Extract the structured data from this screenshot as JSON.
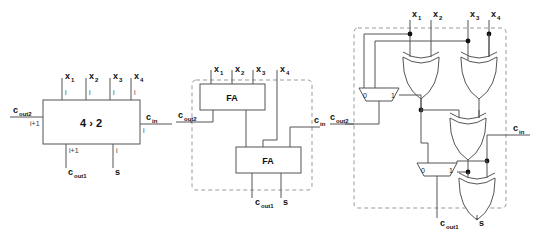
{
  "figure": {
    "background": "#ffffff",
    "line_color": "#555555",
    "dash_color": "#999999",
    "text_color": "#111111"
  },
  "panel_block": {
    "name": "block-symbol",
    "box_label": "4 › 2",
    "inputs_top": [
      {
        "label": "x",
        "sub": "1",
        "width": "i"
      },
      {
        "label": "x",
        "sub": "2",
        "width": "i"
      },
      {
        "label": "x",
        "sub": "3",
        "width": "i"
      },
      {
        "label": "x",
        "sub": "4",
        "width": "i"
      }
    ],
    "port_left": {
      "label": "c",
      "sub": "out2",
      "width": "i+1"
    },
    "port_right": {
      "label": "c",
      "sub": "in",
      "width": "i"
    },
    "outputs_bottom": [
      {
        "label": "c",
        "sub": "out1",
        "width": "i+1"
      },
      {
        "label": "s",
        "sub": "",
        "width": "i"
      }
    ]
  },
  "panel_fa": {
    "name": "full-adder-decomposition",
    "gate_label_top": "FA",
    "gate_label_bottom": "FA",
    "inputs_top": [
      {
        "label": "x",
        "sub": "1"
      },
      {
        "label": "x",
        "sub": "2"
      },
      {
        "label": "x",
        "sub": "3"
      },
      {
        "label": "x",
        "sub": "4"
      }
    ],
    "port_left": {
      "label": "c",
      "sub": "out2"
    },
    "port_right": {
      "label": "c",
      "sub": "in"
    },
    "outputs_bottom": [
      {
        "label": "c",
        "sub": "out1"
      },
      {
        "label": "s",
        "sub": ""
      }
    ]
  },
  "panel_gates": {
    "name": "gate-level-schematic",
    "inputs_top": [
      {
        "label": "x",
        "sub": "1"
      },
      {
        "label": "x",
        "sub": "2"
      },
      {
        "label": "x",
        "sub": "3"
      },
      {
        "label": "x",
        "sub": "4"
      }
    ],
    "port_left": {
      "label": "c",
      "sub": "out2"
    },
    "port_right": {
      "label": "c",
      "sub": "in"
    },
    "outputs_bottom": [
      {
        "label": "c",
        "sub": "out1"
      },
      {
        "label": "s",
        "sub": ""
      }
    ],
    "mux_upper": {
      "in0": "0",
      "in1": "1"
    },
    "mux_lower": {
      "in0": "0",
      "in1": "1"
    },
    "xor_count": 4,
    "mux_count": 2
  }
}
